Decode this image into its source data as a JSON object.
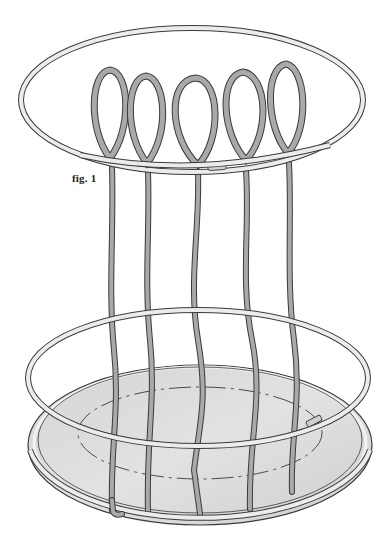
{
  "figure": {
    "caption": "fig. 1",
    "caption_pos": {
      "x": 72,
      "y": 172
    },
    "colors": {
      "background": "#ffffff",
      "outline": "#3a3a3a",
      "hoop_fill": "#e6e6e6",
      "stake_fill": "#a9a9a9",
      "base_fill": "#d9d9d9",
      "dash": "#3a3a3a"
    },
    "top_hoop": {
      "cx": 192,
      "cy": 100,
      "rx": 171,
      "ry": 72
    },
    "middle_hoop": {
      "cx": 198,
      "cy": 378,
      "rx": 170,
      "ry": 68
    },
    "base": {
      "cx": 200,
      "cy": 445,
      "rx": 172,
      "ry": 80
    },
    "dashed_oval": {
      "cx": 200,
      "cy": 433,
      "rx": 122,
      "ry": 46
    }
  }
}
